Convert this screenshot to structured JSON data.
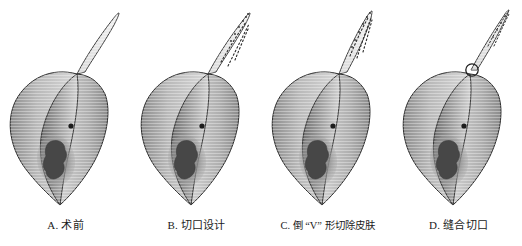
{
  "figure": {
    "background_color": "#ffffff",
    "panel_count": 4,
    "ink_color": "#1a1a1a"
  },
  "panels": [
    {
      "id": "panel-a",
      "caption": "A. 术前",
      "label_letter": "A",
      "stage": "preoperative",
      "tip_style": "intact",
      "has_dashed_incision_marks": false,
      "has_suture_knot": false,
      "tip_width": "wide",
      "left": 0
    },
    {
      "id": "panel-b",
      "caption": "B. 切口设计",
      "label_letter": "B",
      "stage": "incision-design",
      "tip_style": "dashed-marked",
      "has_dashed_incision_marks": true,
      "has_suture_knot": false,
      "tip_width": "wide",
      "left": 131
    },
    {
      "id": "panel-c",
      "caption": "C. 倒 “V” 形切除皮肤",
      "label_letter": "C",
      "stage": "inverted-v-skin-excision",
      "tip_style": "dashed-marked",
      "has_dashed_incision_marks": true,
      "has_suture_knot": false,
      "tip_width": "wide",
      "left": 262
    },
    {
      "id": "panel-d",
      "caption": "D. 缝合切口",
      "label_letter": "D",
      "stage": "sutured-incision",
      "tip_style": "sutured",
      "has_dashed_incision_marks": true,
      "has_suture_knot": true,
      "tip_width": "narrow",
      "left": 393
    }
  ],
  "anatomy": {
    "body_shape": "leaf-like-elongated-lobe",
    "tip_shape": "tapering-projection",
    "lesion_label": "irregular-dark-lesion",
    "lesion_color": "#4a4a4a",
    "lesion_halo_color": "#8e8e8e",
    "dot_label": "small-dark-dot",
    "dot_color": "#1d1d1d",
    "shading": "horizontal-hatch-gradient",
    "outline_color": "#262626",
    "fill_light": "#e8e8e8",
    "fill_mid": "#b4b4b4",
    "fill_dark": "#6f6f6f"
  }
}
